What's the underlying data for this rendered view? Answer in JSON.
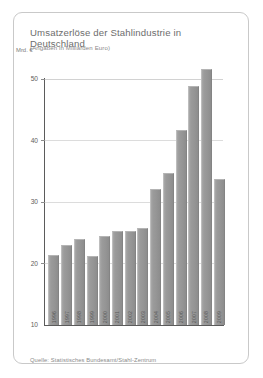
{
  "card": {
    "title": "Umsatzerlöse der Stahlindustrie in Deutschland",
    "subtitle": "(Angaben in Milliarden Euro)",
    "source": "Quelle: Statistisches Bundesamt/Stahl-Zentrum"
  },
  "chart_data": {
    "type": "bar",
    "title": "Umsatzerlöse der Stahlindustrie in Deutschland",
    "subtitle": "(Angaben in Milliarden Euro)",
    "xlabel": "",
    "ylabel": "Mrd. €",
    "ylim": [
      10,
      50
    ],
    "yticks": [
      10,
      20,
      30,
      40,
      50
    ],
    "grid": true,
    "legend": false,
    "bar_color": "#9a9a9a",
    "categories": [
      "1996",
      "1997",
      "1998",
      "1999",
      "2000",
      "2001",
      "2002",
      "2003",
      "2004",
      "2005",
      "2006",
      "2007",
      "2008",
      "2009"
    ],
    "values": [
      21.3,
      22.9,
      23.8,
      21.1,
      24.3,
      25.2,
      25.1,
      25.6,
      32.0,
      34.5,
      41.5,
      48.7,
      51.4,
      33.5
    ],
    "note": "Y-axis truncated at 10; bar year labels rotated 90° inside bar bases"
  }
}
